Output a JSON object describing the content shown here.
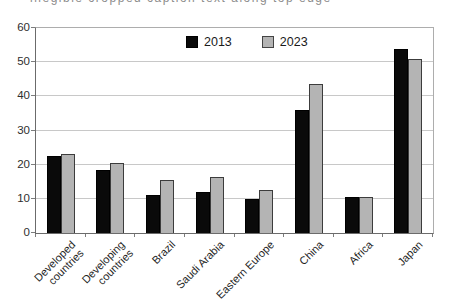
{
  "cropped_caption": {
    "text": "illegible cropped caption text along top edge"
  },
  "legend": {
    "items": [
      {
        "label": "2013",
        "color": "#0a0a0a"
      },
      {
        "label": "2023",
        "color": "#b4b4b4"
      }
    ]
  },
  "chart_data": {
    "type": "bar",
    "title": "",
    "xlabel": "",
    "ylabel": "",
    "categories": [
      "Developed countries",
      "Developing countries",
      "Brazil",
      "Saudi Arabia",
      "Eastern Europe",
      "China",
      "Africa",
      "Japan"
    ],
    "category_lines": [
      [
        "Developed",
        "countries"
      ],
      [
        "Developing",
        "countries"
      ],
      [
        "Brazil"
      ],
      [
        "Saudi Arabia"
      ],
      [
        "Eastern Europe"
      ],
      [
        "China"
      ],
      [
        "Africa"
      ],
      [
        "Japan"
      ]
    ],
    "series": [
      {
        "name": "2013",
        "color": "#0a0a0a",
        "values": [
          22.5,
          18.5,
          11,
          12,
          10,
          36,
          10.5,
          54
        ]
      },
      {
        "name": "2023",
        "color": "#b4b4b4",
        "values": [
          23,
          20.5,
          15.5,
          16.5,
          12.5,
          43.5,
          10.5,
          51
        ]
      }
    ],
    "ylim": [
      0,
      60
    ],
    "yticks": [
      0,
      10,
      20,
      30,
      40,
      50,
      60
    ],
    "grid": true,
    "legend_position": "top-center-inside",
    "colors": {
      "bar_2013": "#0a0a0a",
      "bar_2023": "#b4b4b4",
      "gridline": "#c8c8c8",
      "axis": "#6b6b6b",
      "frame": "#adadad",
      "text": "#1f1f1f"
    }
  }
}
